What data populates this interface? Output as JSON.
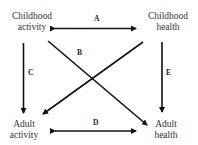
{
  "nodes": {
    "childhood_activity": {
      "line1": "Childhood",
      "line2": "activity"
    },
    "childhood_health": {
      "line1": "Childhood",
      "line2": "health"
    },
    "adult_activity": {
      "line1": "Adult",
      "line2": "activity"
    },
    "adult_health": {
      "line1": "Adult",
      "line2": "health"
    }
  },
  "edges": {
    "A": {
      "label": "A",
      "from": "Childhood activity",
      "to": "Childhood health",
      "type": "bidirectional"
    },
    "B": {
      "label": "B",
      "from": "Childhood activity",
      "to": "Adult health",
      "type": "directed"
    },
    "C": {
      "label": "C",
      "from": "Childhood activity",
      "to": "Adult activity",
      "type": "directed"
    },
    "D": {
      "label": "D",
      "from": "Adult activity",
      "to": "Adult health",
      "type": "bidirectional"
    },
    "E": {
      "label": "E",
      "from": "Childhood health",
      "to": "Adult health",
      "type": "directed"
    },
    "F": {
      "from": "Childhood health",
      "to": "Adult activity",
      "type": "directed"
    }
  }
}
